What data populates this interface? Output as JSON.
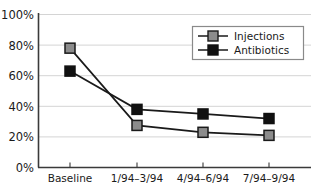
{
  "chart_data": {
    "type": "line",
    "title": "",
    "subtitle": "",
    "xlabel": "",
    "ylabel": "",
    "categories": [
      "Baseline",
      "1/94–3/94",
      "4/94–6/94",
      "7/94–9/94"
    ],
    "series": [
      {
        "name": "Injections",
        "values": [
          78,
          27.5,
          23,
          21
        ],
        "color": "#8c8c8c",
        "marker": "square",
        "marker_edge_color": "#1a1a1a",
        "line_color": "#1a1a1a"
      },
      {
        "name": "Antibiotics",
        "values": [
          63,
          38,
          35,
          32
        ],
        "color": "#111111",
        "marker": "square",
        "marker_edge_color": "#111111",
        "line_color": "#1a1a1a"
      }
    ],
    "ylim": [
      0,
      100
    ],
    "yticks": [
      0,
      20,
      40,
      60,
      80,
      100
    ],
    "ytick_labels": [
      "0%",
      "20%",
      "40%",
      "60%",
      "80%",
      "100%"
    ],
    "grid": true,
    "grid_axis": "y",
    "grid_color": "#d4d4d4",
    "axis_color": "#3a3a3a",
    "background": "#ffffff",
    "legend_position": "upper right",
    "legend_border_color": "#8a8a8a",
    "legend_background": "#ffffff"
  },
  "legend": {
    "entries": [
      {
        "label": "Injections"
      },
      {
        "label": "Antibiotics"
      }
    ]
  },
  "axes": {
    "y_tick_labels": [
      "100%",
      "80%",
      "60%",
      "40%",
      "20%",
      "0%"
    ],
    "x_tick_labels": [
      "Baseline",
      "1/94–3/94",
      "4/94–6/94",
      "7/94–9/94"
    ]
  }
}
